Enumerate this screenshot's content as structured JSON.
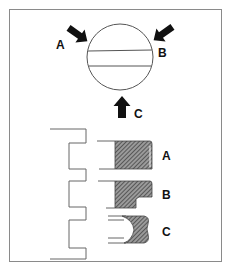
{
  "figure": {
    "type": "technical-diagram",
    "top": {
      "labels": {
        "a": "A",
        "b": "B",
        "c": "C"
      }
    },
    "bottom": {
      "profiles": [
        {
          "label": "A",
          "shape": "rectangular-hatched"
        },
        {
          "label": "B",
          "shape": "stepped-hatched"
        },
        {
          "label": "C",
          "shape": "concave-hatched"
        }
      ]
    },
    "colors": {
      "line": "#555555",
      "fill_hatch": "#444444",
      "arrow": "#111111",
      "border": "#888888"
    }
  }
}
